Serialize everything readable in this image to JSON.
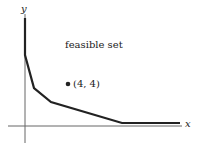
{
  "diagram": {
    "axes": {
      "x_label": "x",
      "y_label": "y"
    },
    "region_label": "feasible set",
    "point": {
      "label": "(4, 4)",
      "x": 4,
      "y": 4
    },
    "boundary_vertices_px": [
      [
        25,
        18
      ],
      [
        25,
        55
      ],
      [
        34,
        88
      ],
      [
        51,
        102
      ],
      [
        122,
        123
      ],
      [
        180,
        123
      ]
    ],
    "colors": {
      "boundary": "#222222",
      "axis": "#555555",
      "text": "#222222"
    }
  }
}
